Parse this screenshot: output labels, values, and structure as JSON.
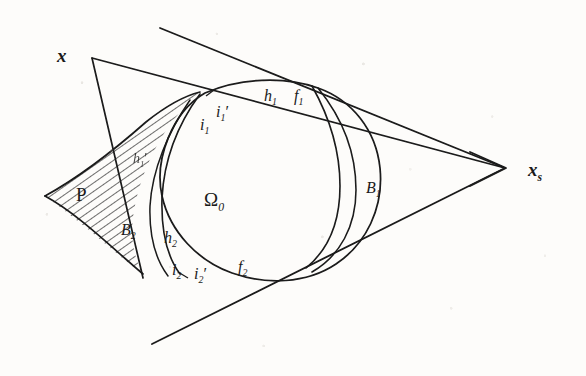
{
  "figure": {
    "medium": "pencil on aged paper",
    "ink_color": "#1a1a1a",
    "paper_color": "#fdfcfa",
    "width": 586,
    "height": 376
  },
  "vertices": [
    {
      "name": "left-apex-label",
      "text": "x",
      "subscript": "",
      "x": 57,
      "y": 46
    },
    {
      "name": "right-apex-label",
      "text": "x",
      "subscript": "s",
      "x": 528,
      "y": 160
    }
  ],
  "labels": [
    {
      "name": "label-i1",
      "base": "i",
      "sub": "1",
      "prime": false,
      "x": 200,
      "y": 117,
      "size": "sz-main"
    },
    {
      "name": "label-i1-prime",
      "base": "i",
      "sub": "1",
      "prime": true,
      "x": 216,
      "y": 104,
      "size": "sz-main"
    },
    {
      "name": "label-h1",
      "base": "h",
      "sub": "1",
      "prime": false,
      "x": 264,
      "y": 88,
      "size": "sz-main"
    },
    {
      "name": "label-f1",
      "base": "f",
      "sub": "1",
      "prime": false,
      "x": 294,
      "y": 88,
      "size": "sz-main"
    },
    {
      "name": "label-B1",
      "base": "B",
      "sub": "1",
      "prime": false,
      "x": 366,
      "y": 180,
      "size": "sz-main"
    },
    {
      "name": "label-B2",
      "base": "B",
      "sub": "2",
      "prime": false,
      "x": 121,
      "y": 222,
      "size": "sz-main"
    },
    {
      "name": "label-h2",
      "base": "h",
      "sub": "2",
      "prime": false,
      "x": 164,
      "y": 230,
      "size": "sz-main"
    },
    {
      "name": "label-i2",
      "base": "i",
      "sub": "2",
      "prime": false,
      "x": 172,
      "y": 262,
      "size": "sz-main"
    },
    {
      "name": "label-i2-prime",
      "base": "i",
      "sub": "2",
      "prime": true,
      "x": 194,
      "y": 266,
      "size": "sz-main"
    },
    {
      "name": "label-f2",
      "base": "f",
      "sub": "2",
      "prime": false,
      "x": 238,
      "y": 259,
      "size": "sz-main"
    },
    {
      "name": "label-hatched-inner",
      "base": "h",
      "sub": "1",
      "prime": true,
      "x": 133,
      "y": 152,
      "size": "sz-small"
    }
  ],
  "region_labels": [
    {
      "name": "label-omega-0",
      "text": "Ω",
      "sub": "0",
      "x": 204,
      "y": 190
    },
    {
      "name": "label-P",
      "text": "P",
      "sub": "",
      "x": 76,
      "y": 185
    }
  ],
  "semantic_parts": {
    "outer_region": "Ω₀",
    "hatched_region": "P",
    "boundary_arcs": [
      "B₁",
      "B₂"
    ],
    "tangent_points": [
      "i₁",
      "i₁'",
      "i₂",
      "i₂'"
    ],
    "support_points": [
      "h₁",
      "h₂"
    ],
    "foot_points": [
      "f₁",
      "f₂"
    ]
  }
}
